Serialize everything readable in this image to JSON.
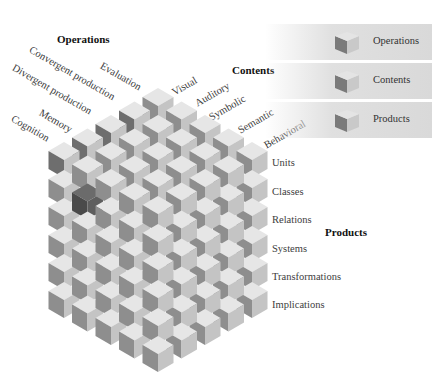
{
  "diagram": {
    "type": "structure-of-intellect-cube",
    "dimensions": {
      "operations": 5,
      "contents": 5,
      "products": 6
    }
  },
  "axes": {
    "operations": {
      "title": "Operations",
      "items": [
        "Evaluation",
        "Convergent production",
        "Divergent production",
        "Memory",
        "Cognition"
      ]
    },
    "contents": {
      "title": "Contents",
      "items": [
        "Visual",
        "Auditory",
        "Symbolic",
        "Semantic",
        "Behavioral"
      ]
    },
    "products": {
      "title": "Products",
      "items": [
        "Units",
        "Classes",
        "Relations",
        "Systems",
        "Transformations",
        "Implications"
      ]
    }
  },
  "legend": {
    "items": [
      {
        "label": "Operations"
      },
      {
        "label": "Contents"
      },
      {
        "label": "Products"
      }
    ]
  },
  "colors": {
    "cube_top": "#e6e6e6",
    "cube_left": "#8e8e8e",
    "cube_right": "#c4c4c4",
    "highlight_left": "#4a4a4a",
    "highlight_top": "#6b6b6b",
    "highlight_right": "#5e5e5e",
    "legend_bg": "#dcdcdc"
  }
}
